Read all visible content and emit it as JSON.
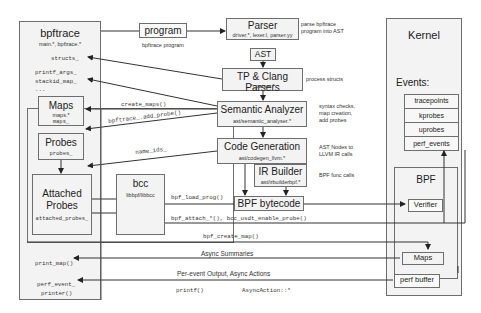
{
  "bpftrace": {
    "title": "bpftrace",
    "files": "main.*, bpftrace.*",
    "structs": "structs_",
    "printf_args": "printf_args_",
    "stackid_map": "stackid_map_",
    "ellipsis": "...",
    "print_map": "print_map()",
    "perf_event_1": "perf_event_",
    "perf_event_2": "printer()"
  },
  "maps_box": {
    "title": "Maps",
    "files": "maps.*",
    "var": "maps_"
  },
  "probes_box": {
    "title": "Probes",
    "var": "probes_"
  },
  "attached_box": {
    "title_1": "Attached",
    "title_2": "Probes",
    "var": "attached_probes_"
  },
  "bcc_box": {
    "title": "bcc",
    "sub": "libbpf/libbcc"
  },
  "program_box": {
    "title": "program",
    "caption": "bpftrace program"
  },
  "parser_box": {
    "title": "Parser",
    "files": "driver.*, lexer.l, parser.yy",
    "note_1": "parse bpftrace",
    "note_2": "program into AST"
  },
  "ast_box": {
    "title": "AST"
  },
  "tp_box": {
    "title": "TP & Clang Parsers",
    "files": "*_parser.*",
    "note": "process structs"
  },
  "semantic_box": {
    "title": "Semantic Analyzer",
    "files": "ast/semantic_analyser.*",
    "note_1": "syntax checks,",
    "note_2": "map creation,",
    "note_3": "add probes"
  },
  "codegen_box": {
    "title": "Code Generation",
    "files": "ast/codegen_llvm.*",
    "note_1": "AST Nodes to",
    "note_2": "LLVM IR calls"
  },
  "irbuilder_box": {
    "title": "IR Builder",
    "files": "ast/irbuilderbpf.*",
    "note": "BPF func calls"
  },
  "bytecode_box": {
    "title": "BPF bytecode"
  },
  "kernel": {
    "title": "Kernel",
    "events_title": "Events:",
    "events": [
      "tracepoints",
      "kprobes",
      "uprobes",
      "perf_events"
    ],
    "bpf_title": "BPF",
    "verifier": "Verifier",
    "maps": "Maps",
    "perf_buffer": "perf buffer"
  },
  "edges": {
    "create_maps": "create_maps()",
    "add_probe": "bpftrace_.add_probe()",
    "name_ids": "name_ids_",
    "load_prog": "bpf_load_prog()",
    "attach": "bpf_attach_*(), bcc_usdt_enable_probe()",
    "create_map": "bpf_create_map()",
    "async_summaries": "Async Summaries",
    "per_event": "Per-event Output, Async Actions",
    "printf": "printf()",
    "async_action": "AsyncAction::*"
  }
}
